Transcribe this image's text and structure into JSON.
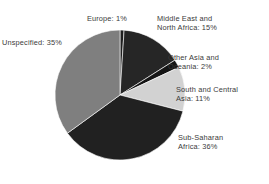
{
  "chart_data": {
    "type": "pie",
    "title": "",
    "subtitle": "",
    "xlabel": "",
    "ylabel": "",
    "legend_position": "none",
    "grid": false,
    "labels_outside": true,
    "start_angle_deg": 0,
    "direction": "clockwise",
    "center": {
      "x": 120,
      "y": 95
    },
    "radius": 65,
    "categories": [
      "Europe",
      "Middle East and North Africa",
      "Other Asia and Oceania",
      "South and Central Asia",
      "Sub-Saharan Africa",
      "Unspecified"
    ],
    "values": [
      1,
      15,
      2,
      11,
      36,
      35
    ],
    "unit": "%",
    "slices": [
      {
        "name": "Europe",
        "value": 1,
        "label": "Europe: 1%",
        "label_lines": [
          "Europe: 1%"
        ],
        "color": "#1f1f1f"
      },
      {
        "name": "Middle East and North Africa",
        "value": 15,
        "label": "Middle East and North Africa: 15%",
        "label_lines": [
          "Middle East and",
          "North Africa: 15%"
        ],
        "color": "#262626"
      },
      {
        "name": "Other Asia and Oceania",
        "value": 2,
        "label": "Other Asia and Oceania: 2%",
        "label_lines": [
          "Other Asia and",
          "Oceania: 2%"
        ],
        "color": "#151515"
      },
      {
        "name": "South and Central Asia",
        "value": 11,
        "label": "South and Central Asia: 11%",
        "label_lines": [
          "South and Central",
          "Asia: 11%"
        ],
        "color": "#d2d2d2"
      },
      {
        "name": "Sub-Saharan Africa",
        "value": 36,
        "label": "Sub-Saharan Africa: 36%",
        "label_lines": [
          "Sub-Saharan",
          "Africa: 36%"
        ],
        "color": "#212121"
      },
      {
        "name": "Unspecified",
        "value": 35,
        "label": "Unspecified: 35%",
        "label_lines": [
          "Unspecified: 35%"
        ],
        "color": "#7f7f7f"
      }
    ],
    "background_color": "#ffffff",
    "label_text_color": "#3a3a3a"
  },
  "labels": {
    "europe": "Europe: 1%",
    "mena": "Middle East and\nNorth Africa: 15%",
    "other_asia": "Other Asia and\nOceania: 2%",
    "south_central": "South and Central\nAsia: 11%",
    "sub_saharan": "Sub-Saharan\nAfrica: 36%",
    "unspecified": "Unspecified: 35%"
  }
}
